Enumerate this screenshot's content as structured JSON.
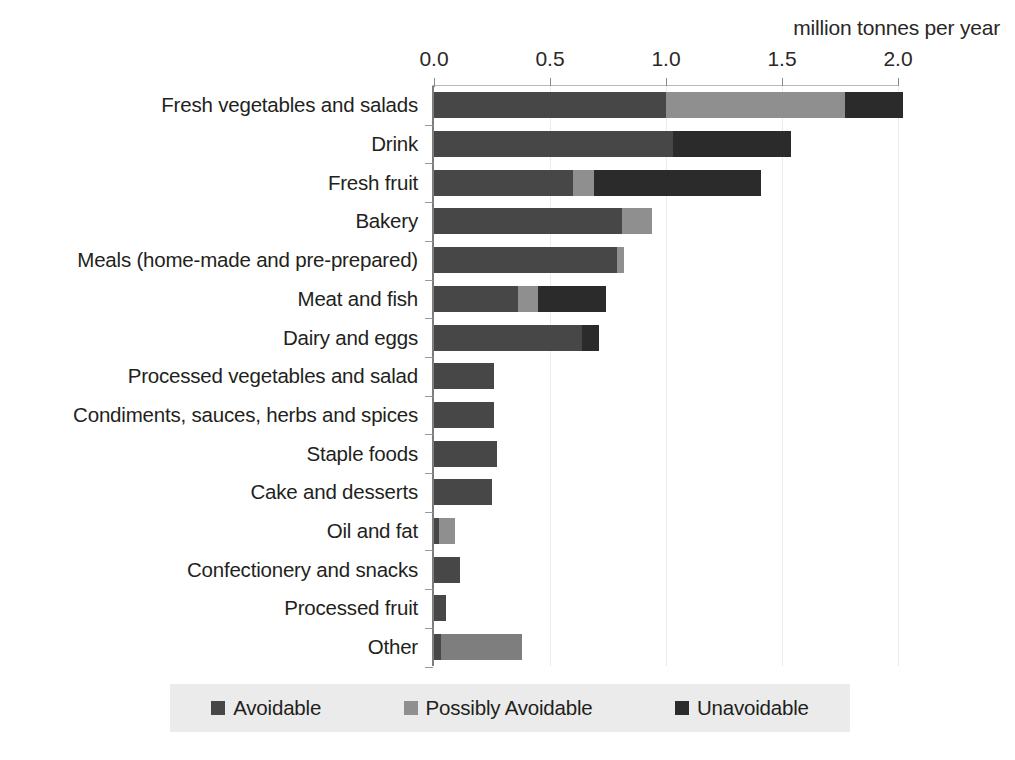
{
  "chart_data": {
    "type": "bar",
    "orientation": "horizontal",
    "stacked": true,
    "title": "",
    "axis_title": "million tonnes per year",
    "xlabel": "million tonnes per year",
    "ylabel": "",
    "xlim": [
      0.0,
      2.0
    ],
    "xticks": [
      0.0,
      0.5,
      1.0,
      1.5,
      2.0
    ],
    "xtick_labels": [
      "0.0",
      "0.5",
      "1.0",
      "1.5",
      "2.0"
    ],
    "grid": false,
    "legend_position": "bottom",
    "legend": [
      "Avoidable",
      "Possibly Avoidable",
      "Unavoidable"
    ],
    "categories": [
      "Fresh vegetables and salads",
      "Drink",
      "Fresh fruit",
      "Bakery",
      "Meals (home-made and pre-prepared)",
      "Meat and fish",
      "Dairy and eggs",
      "Processed vegetables and salad",
      "Condiments, sauces, herbs and spices",
      "Staple foods",
      "Cake and desserts",
      "Oil and fat",
      "Confectionery and snacks",
      "Processed fruit",
      "Other"
    ],
    "series": [
      {
        "name": "Avoidable",
        "color": "#474747",
        "values": [
          1.0,
          1.03,
          0.6,
          0.81,
          0.79,
          0.36,
          0.64,
          0.26,
          0.26,
          0.27,
          0.25,
          0.02,
          0.11,
          0.05,
          0.03
        ]
      },
      {
        "name": "Possibly Avoidable",
        "color": "#8f8f8f",
        "values": [
          0.77,
          0.0,
          0.09,
          0.13,
          0.03,
          0.09,
          0.0,
          0.0,
          0.0,
          0.0,
          0.0,
          0.07,
          0.0,
          0.0,
          0.35
        ]
      },
      {
        "name": "Unavoidable",
        "color": "#2b2b2b",
        "values": [
          0.25,
          0.51,
          0.72,
          0.0,
          0.0,
          0.29,
          0.07,
          0.0,
          0.0,
          0.0,
          0.0,
          0.0,
          0.0,
          0.0,
          0.0
        ]
      }
    ],
    "totals": [
      2.02,
      1.54,
      1.41,
      0.94,
      0.82,
      0.74,
      0.71,
      0.26,
      0.26,
      0.27,
      0.25,
      0.09,
      0.11,
      0.05,
      0.38
    ]
  },
  "legend": {
    "items": [
      {
        "label": "Avoidable",
        "color": "#474747"
      },
      {
        "label": "Possibly Avoidable",
        "color": "#8f8f8f"
      },
      {
        "label": "Unavoidable",
        "color": "#2b2b2b"
      }
    ]
  }
}
